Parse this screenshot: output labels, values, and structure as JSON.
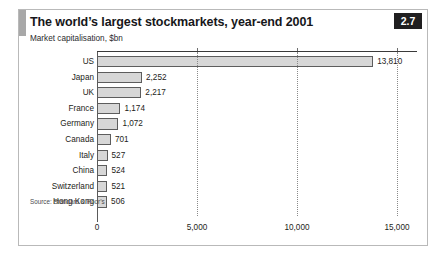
{
  "figure": {
    "title": "The world’s largest stockmarkets, year-end 2001",
    "subtitle": "Market capitalisation, $bn",
    "badge": "2.7",
    "source": "Source: Standard & Poor’s",
    "accent_color": "#a8a8a8",
    "bar_fill_color": "#d7d7d7",
    "bar_border_color": "#5d5d5d",
    "badge_bg_color": "#201f20",
    "frame_border_color": "#b9b9b9"
  },
  "chart_data": {
    "type": "bar",
    "orientation": "horizontal",
    "title": "The world’s largest stockmarkets, year-end 2001",
    "subtitle": "Market capitalisation, $bn",
    "xlabel": "",
    "ylabel": "",
    "xlim": [
      0,
      16000
    ],
    "grid": true,
    "gridlines_style": "dotted-vertical",
    "legend": false,
    "axis_top": true,
    "xticks": [
      0,
      5000,
      10000,
      15000
    ],
    "xtick_labels": [
      "0",
      "5,000",
      "10,000",
      "15,000"
    ],
    "categories": [
      "US",
      "Japan",
      "UK",
      "France",
      "Germany",
      "Canada",
      "Italy",
      "China",
      "Switzerland",
      "Hong Kong"
    ],
    "values": [
      13810,
      2252,
      2217,
      1174,
      1072,
      701,
      527,
      524,
      521,
      506
    ],
    "value_labels": [
      "13,810",
      "2,252",
      "2,217",
      "1,174",
      "1,072",
      "701",
      "527",
      "524",
      "521",
      "506"
    ],
    "source": "Source: Standard & Poor’s"
  }
}
